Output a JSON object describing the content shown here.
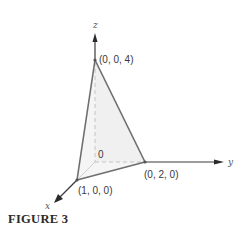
{
  "figure": {
    "caption": "FIGURE 3",
    "axes": {
      "x_label": "x",
      "y_label": "y",
      "z_label": "z",
      "origin_label": "0"
    },
    "vertices": [
      {
        "label": "(0, 0, 4)",
        "coords": [
          0,
          0,
          4
        ]
      },
      {
        "label": "(0, 2, 0)",
        "coords": [
          0,
          2,
          0
        ]
      },
      {
        "label": "(1, 0, 0)",
        "coords": [
          1,
          0,
          0
        ]
      }
    ],
    "colors": {
      "edge": "#6e6e6e",
      "axis": "#3a3a3a",
      "hidden_edge": "#bdbdbd",
      "face_shade": "#f4f4f4"
    }
  }
}
